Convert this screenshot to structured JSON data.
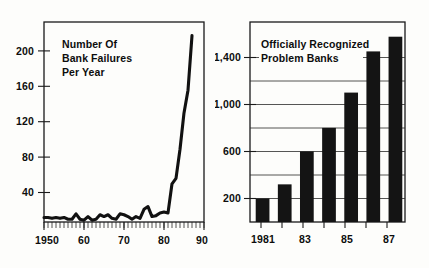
{
  "figure": {
    "background_color": "#fdfdfb",
    "ink_color": "#111111"
  },
  "chart_data": [
    {
      "type": "line",
      "id": "bank-failures",
      "title": "Number Of Bank Failures Per Year",
      "title_lines": [
        "Number Of",
        "Bank Failures",
        "Per Year"
      ],
      "xlabel": "",
      "ylabel": "",
      "xlim": [
        1950,
        1990
      ],
      "ylim": [
        0,
        220
      ],
      "grid": false,
      "legend": null,
      "x_tick_labels": [
        "1950",
        "60",
        "70",
        "80",
        "90"
      ],
      "x_tick_values": [
        1950,
        1960,
        1970,
        1980,
        1990
      ],
      "y_tick_labels": [
        "40",
        "80",
        "120",
        "160",
        "200"
      ],
      "y_tick_values": [
        40,
        80,
        120,
        160,
        200
      ],
      "minor_x_tick_interval": 1,
      "x": [
        1950,
        1951,
        1952,
        1953,
        1954,
        1955,
        1956,
        1957,
        1958,
        1959,
        1960,
        1961,
        1962,
        1963,
        1964,
        1965,
        1966,
        1967,
        1968,
        1969,
        1970,
        1971,
        1972,
        1973,
        1974,
        1975,
        1976,
        1977,
        1978,
        1979,
        1980,
        1981,
        1982,
        1983,
        1984,
        1985,
        1986,
        1987
      ],
      "values": [
        5,
        5,
        4,
        5,
        4,
        5,
        3,
        3,
        9,
        3,
        2,
        6,
        2,
        3,
        8,
        6,
        8,
        4,
        3,
        9,
        8,
        6,
        3,
        6,
        4,
        14,
        17,
        6,
        7,
        10,
        11,
        10,
        42,
        48,
        80,
        120,
        145,
        205
      ],
      "line_width": 3.1,
      "line_color": "#111111"
    },
    {
      "type": "bar",
      "id": "problem-banks",
      "title": "Officially Recognized Problem Banks",
      "title_lines": [
        "Officially Recognized",
        "Problem Banks"
      ],
      "xlabel": "",
      "ylabel": "",
      "ylim": [
        0,
        1700
      ],
      "grid": true,
      "grid_axis": "y",
      "legend": null,
      "categories": [
        "1981",
        "1982",
        "1983",
        "1984",
        "1985",
        "1986",
        "1987"
      ],
      "x_tick_labels": [
        "1981",
        "83",
        "85",
        "87"
      ],
      "x_tick_label_categories": [
        "1981",
        "1983",
        "1985",
        "1987"
      ],
      "y_tick_labels": [
        "200",
        "600",
        "1,000",
        "1,400"
      ],
      "y_tick_values": [
        200,
        600,
        1000,
        1400
      ],
      "gridline_values": [
        200,
        400,
        600,
        800,
        1000,
        1200,
        1400
      ],
      "values": [
        200,
        320,
        600,
        800,
        1100,
        1450,
        1575
      ],
      "bar_color": "#141414"
    }
  ]
}
